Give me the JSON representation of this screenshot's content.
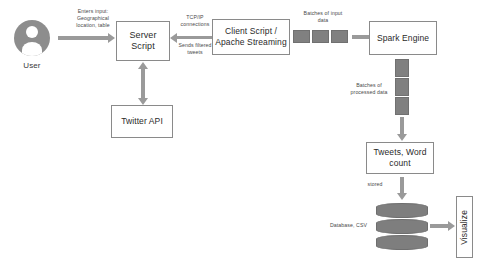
{
  "diagram": {
    "colors": {
      "node_border": "#8a8a8a",
      "arrow": "#9a9a9a",
      "batch_fill": "#808080",
      "avatar_fill": "#8d8d8d",
      "database_fill": "#7e7e7e",
      "text": "#2a2a2a",
      "caption_text": "#4a4a4a",
      "background": "#ffffff"
    },
    "nodes": {
      "user": "User",
      "server_script": "Server\nScript",
      "twitter_api": "Twitter API",
      "client_script": "Client Script /\nApache Streaming",
      "spark_engine": "Spark Engine",
      "tweets_word_count": "Tweets, Word\ncount",
      "visualize": "Visualize"
    },
    "captions": {
      "enters_input": "Enters input:\nGeographical\nlocation, table",
      "tcp_ip": "TCP/IP\nconnections",
      "sends_filtered": "Sends filtered\ntweets",
      "batches_input": "Batches of input\ndata",
      "batches_processed": "Batches of\nprocessed data",
      "stored": "stored",
      "database_csv": "Database, CSV"
    },
    "icons": {
      "user_avatar": "user-avatar-icon",
      "database": "database-cylinder-icon"
    },
    "batches": {
      "input_count": 3,
      "processed_count": 3,
      "database_disc_count": 3
    }
  }
}
